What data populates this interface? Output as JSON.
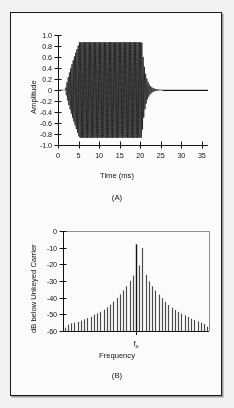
{
  "figure": {
    "panels": [
      {
        "caption": "(A)",
        "chart_data": {
          "type": "line",
          "title": "",
          "xlabel": "Time (ms)",
          "ylabel": "Amplitude",
          "xlim": [
            0,
            36.5
          ],
          "ylim": [
            -1.0,
            1.0
          ],
          "xticks": [
            0,
            5,
            10,
            15,
            20,
            25,
            30,
            35
          ],
          "xticklabels": [
            "0",
            "5",
            "10",
            "15",
            "20",
            "25",
            "30",
            "35"
          ],
          "yticks": [
            -1.0,
            -0.8,
            -0.6,
            -0.4,
            -0.2,
            0,
            0.2,
            0.4,
            0.6,
            0.8,
            1.0
          ],
          "yticklabels": [
            "-1.0",
            "-0.8",
            "-0.6",
            "-0.4",
            "-0.2",
            "0",
            "0.2",
            "0.4",
            "0.6",
            "0.8",
            "1.0"
          ],
          "grid": false,
          "legend": "none",
          "description": "Keyed CW carrier burst: amplitude envelope rises from 0 at t=1.8 ms to full amplitude 0.87 at t=5.2 ms, holds flat until t=20.4 ms, then decays exponentially ringing down to zero by t=25.5 ms and stays at 0 to t=36.",
          "envelope": {
            "rise_start_ms": 1.8,
            "rise_end_ms": 5.2,
            "hold_amplitude": 0.87,
            "key_off_ms": 20.4,
            "decay_time_constant_ms": 0.85,
            "settle_ms": 25.5,
            "carrier_cycles_visible": 78
          }
        }
      },
      {
        "caption": "(B)",
        "chart_data": {
          "type": "bar",
          "title": "",
          "xlabel": "Frequency",
          "ylabel": "dB below Unkeyed Carrier",
          "center_tick_label": "f",
          "center_tick_sub": "o",
          "xlim": [
            -22.5,
            22.5
          ],
          "ylim": [
            -60,
            0
          ],
          "yticks": [
            0,
            -10,
            -20,
            -30,
            -40,
            -50,
            -60
          ],
          "yticklabels": [
            "0",
            "-10",
            "-20",
            "-30",
            "-40",
            "-50",
            "-60"
          ],
          "grid": false,
          "legend": "none",
          "description": "Keying sideband spectrum, symmetric about the carrier f-sub-o. Discrete sidebands spaced at the keying rate, peak carrier component at -8 dB, sidebands falling off roughly linearly in dB to -58 dB at the +/-22nd sideband.",
          "categories": [
            -22,
            -21,
            -20,
            -19,
            -18,
            -17,
            -16,
            -15,
            -14,
            -13,
            -12,
            -11,
            -10,
            -9,
            -8,
            -7,
            -6,
            -5,
            -4,
            -3,
            -2,
            -1,
            0,
            1,
            2,
            3,
            4,
            5,
            6,
            7,
            8,
            9,
            10,
            11,
            12,
            13,
            14,
            15,
            16,
            17,
            18,
            19,
            20,
            21,
            22
          ],
          "values": [
            -58.0,
            -56.2,
            -55.4,
            -55.0,
            -54.6,
            -53.8,
            -53.0,
            -52.2,
            -51.4,
            -50.2,
            -49.4,
            -48.4,
            -47.2,
            -45.8,
            -44.2,
            -42.4,
            -40.2,
            -38.0,
            -35.6,
            -33.2,
            -30.0,
            -26.8,
            -8.0,
            -20.6,
            -10.2,
            -26.4,
            -30.2,
            -33.2,
            -35.8,
            -38.2,
            -40.4,
            -42.6,
            -44.4,
            -46.0,
            -47.4,
            -48.6,
            -49.6,
            -50.6,
            -51.6,
            -52.6,
            -53.4,
            -54.2,
            -55.0,
            -55.8,
            -57.4
          ],
          "carrier_index": 22,
          "carrier_level_db": -8.0
        }
      }
    ]
  },
  "colors": {
    "ink": "#111111",
    "frame": "#1a1a1a",
    "paper": "#fbfbfa",
    "page": "#f2f1ef",
    "bar": "#4a4a4a"
  }
}
